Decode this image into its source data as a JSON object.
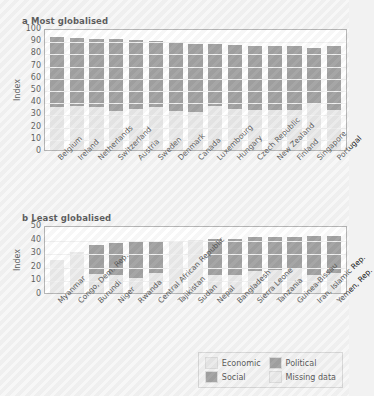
{
  "figure": {
    "background_color": "#f4f4f4",
    "bar_colors": {
      "economic": "#e2e2e2",
      "political": "#808080",
      "social": "#808080",
      "missing_data": "#e6e6e6"
    }
  },
  "legend": {
    "position": "bottom-right",
    "items": [
      {
        "label": "Economic",
        "color": "#e2e2e2"
      },
      {
        "label": "Political",
        "color": "#808080"
      },
      {
        "label": "Social",
        "color": "#808080"
      },
      {
        "label": "Missing data",
        "color": "#e6e6e6"
      }
    ]
  },
  "panel_a": {
    "title": "a Most globalised",
    "ylabel": "Index"
  },
  "panel_b": {
    "title": "b Least globalised",
    "ylabel": "Index"
  },
  "chart_data": [
    {
      "id": "panel_a",
      "type": "bar",
      "stacked": true,
      "title": "a Most globalised",
      "xlabel": "",
      "ylabel": "Index",
      "ylim": [
        0,
        100
      ],
      "yticks": [
        0,
        10,
        20,
        30,
        40,
        50,
        60,
        70,
        80,
        90,
        100
      ],
      "grid": true,
      "legend_position": "bottom-right",
      "categories": [
        "Belgium",
        "Ireland",
        "Netherlands",
        "Switzerland",
        "Austria",
        "Sweden",
        "Denmark",
        "Canada",
        "Luxembourg",
        "Hungary",
        "Czech Republic",
        "New Zealand",
        "Finland",
        "Singapore",
        "Portugal"
      ],
      "series": [
        {
          "name": "Economic",
          "color": "#e2e2e2",
          "values": [
            35,
            36,
            35,
            32,
            34,
            35,
            32,
            31,
            36,
            34,
            33,
            33,
            33,
            38,
            33
          ]
        },
        {
          "name": "Social/Political",
          "color": "#808080",
          "values": [
            58,
            56,
            56,
            59,
            56,
            54,
            56,
            56,
            51,
            52,
            52,
            52,
            52,
            46,
            52
          ]
        }
      ],
      "totals": [
        93,
        92,
        91,
        91,
        90,
        89,
        88,
        87,
        87,
        86,
        85,
        85,
        85,
        84,
        84
      ],
      "missing_data_categories": []
    },
    {
      "id": "panel_b",
      "type": "bar",
      "stacked": true,
      "title": "b Least globalised",
      "xlabel": "",
      "ylabel": "Index",
      "ylim": [
        0,
        50
      ],
      "yticks": [
        0,
        10,
        20,
        30,
        40,
        50
      ],
      "grid": true,
      "legend_position": "bottom-right",
      "categories": [
        "Myanmar",
        "Congo, Dem. Rep.",
        "Burundi",
        "Niger",
        "Rwanda",
        "Central African Republic",
        "Tajikistan",
        "Sudan",
        "Nepal",
        "Bangladesh",
        "Sierra Leone",
        "Tanzania",
        "Guinea-Bissau",
        "Iran, Islamic Rep.",
        "Yemen, Rep."
      ],
      "series": [
        {
          "name": "Economic",
          "color": "#e2e2e2",
          "values": [
            24,
            30,
            14,
            13,
            11,
            15,
            38,
            39,
            13,
            13,
            16,
            17,
            18,
            13,
            15
          ]
        },
        {
          "name": "Social/Political",
          "color": "#808080",
          "values": [
            0,
            0,
            21,
            24,
            27,
            23,
            0,
            0,
            27,
            27,
            25,
            24,
            23,
            29,
            27
          ]
        }
      ],
      "totals": [
        24,
        30,
        35,
        37,
        38,
        38,
        38,
        39,
        40,
        40,
        41,
        41,
        41,
        42,
        42
      ],
      "missing_data_categories": [
        "Myanmar",
        "Congo, Dem. Rep.",
        "Tajikistan",
        "Sudan"
      ]
    }
  ]
}
